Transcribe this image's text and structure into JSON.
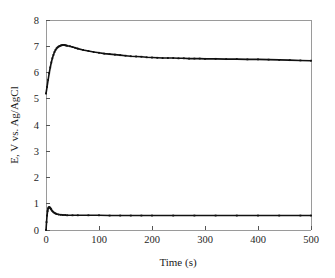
{
  "chart_data": {
    "type": "line",
    "title": "",
    "xlabel": "Time (s)",
    "ylabel": "E, V vs. Ag/AgCl",
    "xlim": [
      0,
      500
    ],
    "ylim": [
      0,
      8
    ],
    "xticks": [
      0,
      100,
      200,
      300,
      400,
      500
    ],
    "yticks": [
      0,
      1,
      2,
      3,
      4,
      5,
      6,
      7,
      8
    ],
    "xtick_labels": [
      "0",
      "100",
      "200",
      "300",
      "400",
      "500"
    ],
    "ytick_labels": [
      "0",
      "1",
      "2",
      "3",
      "4",
      "5",
      "6",
      "7",
      "8"
    ],
    "grid": false,
    "legend": null,
    "legend_position": "none",
    "series": [
      {
        "name": "upper-trace",
        "marker": "square",
        "color": "#111111",
        "x": [
          0,
          2,
          4,
          6,
          8,
          10,
          12,
          14,
          16,
          18,
          20,
          22,
          24,
          26,
          28,
          30,
          32,
          34,
          36,
          38,
          40,
          45,
          50,
          55,
          60,
          70,
          80,
          90,
          100,
          110,
          120,
          130,
          140,
          150,
          160,
          170,
          180,
          190,
          200,
          210,
          220,
          230,
          240,
          250,
          260,
          270,
          280,
          290,
          300,
          320,
          340,
          360,
          380,
          400,
          420,
          440,
          460,
          480,
          500
        ],
        "y": [
          5.2,
          5.45,
          5.72,
          5.97,
          6.19,
          6.38,
          6.54,
          6.67,
          6.78,
          6.86,
          6.92,
          6.96,
          6.99,
          7.01,
          7.03,
          7.04,
          7.05,
          7.05,
          7.04,
          7.03,
          7.02,
          7.0,
          6.97,
          6.94,
          6.91,
          6.86,
          6.82,
          6.78,
          6.75,
          6.72,
          6.7,
          6.68,
          6.66,
          6.64,
          6.62,
          6.61,
          6.6,
          6.58,
          6.57,
          6.56,
          6.55,
          6.55,
          6.55,
          6.54,
          6.54,
          6.53,
          6.53,
          6.53,
          6.52,
          6.52,
          6.51,
          6.51,
          6.5,
          6.5,
          6.49,
          6.48,
          6.47,
          6.46,
          6.45
        ]
      },
      {
        "name": "lower-trace",
        "marker": "square",
        "color": "#111111",
        "x": [
          0,
          1,
          2,
          3,
          4,
          5,
          6,
          7,
          8,
          9,
          10,
          12,
          14,
          16,
          18,
          20,
          24,
          28,
          32,
          36,
          40,
          50,
          60,
          80,
          100,
          120,
          140,
          160,
          180,
          200,
          240,
          280,
          320,
          360,
          400,
          440,
          480,
          500
        ],
        "y": [
          0.0,
          0.3,
          0.55,
          0.72,
          0.82,
          0.86,
          0.87,
          0.86,
          0.84,
          0.81,
          0.78,
          0.72,
          0.68,
          0.65,
          0.63,
          0.61,
          0.59,
          0.58,
          0.57,
          0.57,
          0.56,
          0.56,
          0.56,
          0.56,
          0.56,
          0.55,
          0.55,
          0.55,
          0.55,
          0.55,
          0.55,
          0.55,
          0.55,
          0.55,
          0.55,
          0.55,
          0.55,
          0.55
        ]
      }
    ]
  },
  "axes": {
    "x_title": "Time (s)",
    "y_title": "E, V vs. Ag/AgCl"
  }
}
